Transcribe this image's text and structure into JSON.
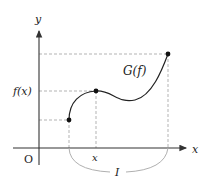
{
  "diagram": {
    "labels": {
      "y_axis": "y",
      "x_axis": "x",
      "origin": "O",
      "fx": "f(x)",
      "x_point": "x",
      "graph": "G(f)",
      "interval": "I"
    },
    "colors": {
      "axis": "#333333",
      "curve": "#222222",
      "dashed": "#aaaaaa",
      "arc": "#b0b0b0",
      "point": "#111111"
    },
    "points": [
      {
        "name": "interval-start",
        "x": 69,
        "y": 120
      },
      {
        "name": "point-x-fx",
        "x": 96,
        "y": 91
      },
      {
        "name": "interval-end",
        "x": 168,
        "y": 54
      }
    ]
  }
}
